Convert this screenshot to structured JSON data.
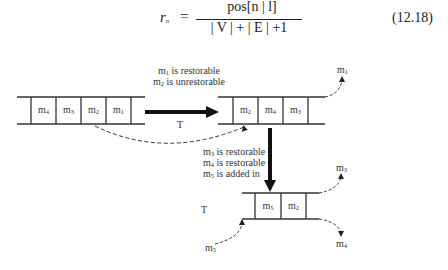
{
  "equation": {
    "lhs": "r",
    "lhs_sub": "n",
    "equals": "=",
    "numerator": "pos[n | l]",
    "denominator": "| V | + | E | +1",
    "number": "(12.18)"
  },
  "diagram": {
    "transition_1": {
      "note_line_1_prefix": "m",
      "note_line_1_sub": "1",
      "note_line_1_suffix": " is restorable",
      "note_line_2_prefix": "m",
      "note_line_2_sub": "2",
      "note_line_2_suffix": " is unrestorable",
      "axis_label": "T"
    },
    "transition_2": {
      "notes": [
        {
          "prefix": "m",
          "sub": "3",
          "suffix": " is restorable"
        },
        {
          "prefix": "m",
          "sub": "4",
          "suffix": " is restorable"
        },
        {
          "prefix": "m",
          "sub": "5",
          "suffix": " is added in"
        }
      ],
      "axis_label": "T"
    },
    "queue_left": {
      "cells": [
        {
          "prefix": "m",
          "sub": "4"
        },
        {
          "prefix": "m",
          "sub": "3"
        },
        {
          "prefix": "m",
          "sub": "2"
        },
        {
          "prefix": "m",
          "sub": "1"
        }
      ]
    },
    "queue_right": {
      "cells": [
        {
          "prefix": "m",
          "sub": "2"
        },
        {
          "prefix": "m",
          "sub": "4"
        },
        {
          "prefix": "m",
          "sub": "3"
        }
      ],
      "evicted": {
        "prefix": "m",
        "sub": "1"
      }
    },
    "queue_bottom": {
      "cells": [
        {
          "prefix": "m",
          "sub": "5"
        },
        {
          "prefix": "m",
          "sub": "2"
        }
      ],
      "evicted_top": {
        "prefix": "m",
        "sub": "3"
      },
      "evicted_bottom": {
        "prefix": "m",
        "sub": "4"
      },
      "incoming": {
        "prefix": "m",
        "sub": "5"
      }
    }
  }
}
